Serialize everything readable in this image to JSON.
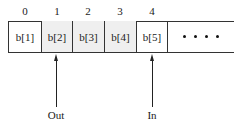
{
  "diagram": {
    "indices": [
      "0",
      "1",
      "2",
      "3",
      "4"
    ],
    "cells": [
      {
        "label": "b[1]",
        "shaded": false
      },
      {
        "label": "b[2]",
        "shaded": true
      },
      {
        "label": "b[3]",
        "shaded": true
      },
      {
        "label": "b[4]",
        "shaded": true
      },
      {
        "label": "b[5]",
        "shaded": false
      }
    ],
    "continuation": "• • • •",
    "pointers": {
      "out": {
        "label": "Out",
        "index": 1
      },
      "in": {
        "label": "In",
        "index": 4
      }
    },
    "colors": {
      "border": "#333333",
      "shaded_fill": "#efefef",
      "background": "#ffffff"
    }
  }
}
